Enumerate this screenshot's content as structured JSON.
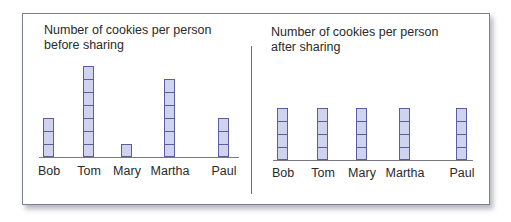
{
  "chart_data": [
    {
      "type": "bar",
      "title": "Number of cookies per person before sharing",
      "title_lines": [
        "Number of cookies per person",
        "before sharing"
      ],
      "categories": [
        "Bob",
        "Tom",
        "Mary",
        "Martha",
        "Paul"
      ],
      "values": [
        3,
        7,
        1,
        6,
        3
      ],
      "xlabel": "",
      "ylabel": "",
      "grid": false,
      "bar_style": "stacked unit squares",
      "colors": {
        "fill": "#cfd3ee",
        "stroke": "#5c5ca0"
      }
    },
    {
      "type": "bar",
      "title": "Number of cookies per person after sharing",
      "title_lines": [
        "Number of cookies per person",
        "after sharing"
      ],
      "categories": [
        "Bob",
        "Tom",
        "Mary",
        "Martha",
        "Paul"
      ],
      "values": [
        4,
        4,
        4,
        4,
        4
      ],
      "xlabel": "",
      "ylabel": "",
      "grid": false,
      "bar_style": "stacked unit squares",
      "colors": {
        "fill": "#cfd3ee",
        "stroke": "#5c5ca0"
      }
    }
  ]
}
